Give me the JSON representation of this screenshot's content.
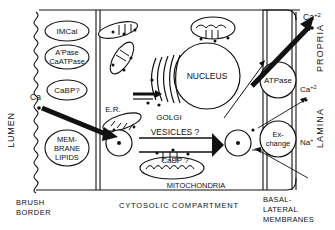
{
  "figure": {
    "background": "#ffffff",
    "ink": "#111111"
  },
  "compartments": {
    "lumen_label": "LUMEN",
    "brush_border_label_line1": "BRUSH",
    "brush_border_label_line2": "BORDER",
    "cytosolic_label_line1": "CYTOSOLIC",
    "cytosolic_label_line2": "COMPARTMENT",
    "basal_lateral_label_line1": "BASAL-",
    "basal_lateral_label_line2": "LATERAL",
    "basal_lateral_label_line3": "MEMBRANES",
    "lamina_propria_label_line1": "LAMINA",
    "lamina_propria_label_line2": "PROPRIA"
  },
  "brush_border_components": [
    {
      "id": "imcal",
      "label_line1": "IMCal",
      "label_line2": ""
    },
    {
      "id": "atpase",
      "label_line1": "A'Pase",
      "label_line2": "CaATPase"
    },
    {
      "id": "cabp",
      "label_line1": "CaBP?",
      "label_line2": ""
    },
    {
      "id": "membrane",
      "label_line1": "MEM-",
      "label_line2": "BRANE",
      "label_line3": "LIPIDS"
    }
  ],
  "basolateral_components": [
    {
      "id": "bl-atpase",
      "label_line1": "ATPase",
      "label_line2": ""
    },
    {
      "id": "bl-exchange",
      "label_line1": "Ex-",
      "label_line2": "change"
    }
  ],
  "organelles": {
    "nucleus_label": "NUCLEUS",
    "golgi_label": "GOLGI",
    "er_label": "E.R.",
    "mitochondria_label": "MITOCHONDRIA"
  },
  "transport": {
    "vesicles_label": "VESICLES ?",
    "vesicle_cabp_label": "CaBP ?"
  },
  "ions": {
    "lumen_calcium": "Ca+2",
    "apical_calcium_sup": "+2",
    "lumen_calcium_base": "Ca",
    "top_right_calcium_base": "Ca",
    "top_right_calcium_sup": "+2",
    "mid_right_calcium_base": "Ca",
    "mid_right_calcium_sup": "+2",
    "sodium_base": "Na",
    "sodium_sup": "+"
  }
}
